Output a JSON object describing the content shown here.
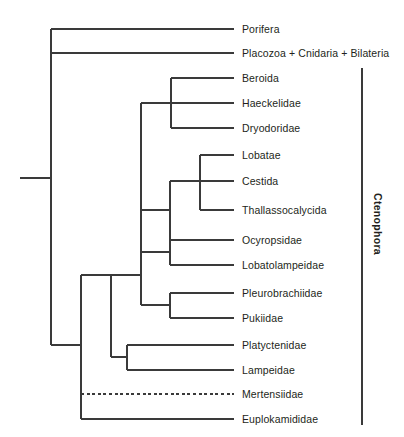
{
  "figure": {
    "type": "phylogenetic-cladogram",
    "background_color": "#ffffff",
    "line_color": "#3a3a3a",
    "text_color": "#231f20",
    "width": 404,
    "height": 437
  },
  "clade_brackets": [
    {
      "label": "Ctenophora",
      "orientation": "vertical-rotated",
      "x": 362,
      "y_top": 68,
      "y_bottom": 425,
      "label_x": 378,
      "label_center_y": 224
    }
  ],
  "taxa": [
    {
      "name": "Porifera",
      "tip_y": 29,
      "branch_x": 51,
      "label_x": 242,
      "style": "solid"
    },
    {
      "name": "Placozoa + Cnidaria + Bilateria",
      "tip_y": 53,
      "branch_x": 51,
      "label_x": 242,
      "style": "solid"
    },
    {
      "name": "Beroida",
      "tip_y": 78,
      "branch_x": 171,
      "label_x": 242,
      "style": "solid"
    },
    {
      "name": "Haeckelidae",
      "tip_y": 103,
      "branch_x": 141,
      "label_x": 242,
      "style": "solid"
    },
    {
      "name": "Dryodoridae",
      "tip_y": 128,
      "branch_x": 171,
      "label_x": 242,
      "style": "solid"
    },
    {
      "name": "Lobatae",
      "tip_y": 155,
      "branch_x": 200,
      "label_x": 242,
      "style": "solid"
    },
    {
      "name": "Cestida",
      "tip_y": 181,
      "branch_x": 170,
      "label_x": 242,
      "style": "solid"
    },
    {
      "name": "Thallassocalycida",
      "tip_y": 210,
      "branch_x": 200,
      "label_x": 242,
      "style": "solid"
    },
    {
      "name": "Ocyropsidae",
      "tip_y": 240,
      "branch_x": 170,
      "label_x": 242,
      "style": "solid"
    },
    {
      "name": "Lobatolampeidae",
      "tip_y": 265,
      "branch_x": 170,
      "label_x": 242,
      "style": "solid"
    },
    {
      "name": "Pleurobrachiidae",
      "tip_y": 293,
      "branch_x": 170,
      "label_x": 242,
      "style": "solid"
    },
    {
      "name": "Pukiidae",
      "tip_y": 318,
      "branch_x": 170,
      "label_x": 242,
      "style": "solid"
    },
    {
      "name": "Platyctenidae",
      "tip_y": 345,
      "branch_x": 127,
      "label_x": 242,
      "style": "solid"
    },
    {
      "name": "Lampeidae",
      "tip_y": 370,
      "branch_x": 127,
      "label_x": 242,
      "style": "solid"
    },
    {
      "name": "Mertensiidae",
      "tip_y": 394,
      "branch_x": 81,
      "label_x": 242,
      "style": "dashed"
    },
    {
      "name": "Euplokamididae",
      "tip_y": 419,
      "branch_x": 81,
      "label_x": 242,
      "style": "solid"
    }
  ],
  "tip_line_end_x": 234,
  "branches": {
    "root_stub": {
      "x1": 20,
      "x2": 51,
      "y": 178
    },
    "vertical_nodes": [
      {
        "name": "root-node",
        "x": 51,
        "y1": 29,
        "y2": 345
      },
      {
        "name": "ctenophora-node",
        "x": 81,
        "y1": 275,
        "y2": 419
      },
      {
        "name": "cydippid-core-node",
        "x": 111,
        "y1": 275,
        "y2": 357
      },
      {
        "name": "tentaculata-node",
        "x": 127,
        "y1": 345,
        "y2": 370
      },
      {
        "name": "beroida-haeckelid-node",
        "x": 171,
        "y1": 78,
        "y2": 128
      },
      {
        "name": "upper-clade-node",
        "x": 141,
        "y1": 103,
        "y2": 305
      },
      {
        "name": "lobate-node",
        "x": 200,
        "y1": 155,
        "y2": 210
      },
      {
        "name": "cestida-lobate-node",
        "x": 170,
        "y1": 181,
        "y2": 240
      },
      {
        "name": "ocyropsid-lobatolampeid-node",
        "x": 170,
        "y1": 240,
        "y2": 265
      },
      {
        "name": "pleurobrachiid-pukiid-node",
        "x": 170,
        "y1": 293,
        "y2": 318
      }
    ],
    "connectors": [
      {
        "name": "root-to-ctenophora",
        "x1": 51,
        "x2": 81,
        "y": 345
      },
      {
        "name": "ctenophora-to-core",
        "x1": 81,
        "x2": 111,
        "y": 275
      },
      {
        "name": "core-to-tentaculata",
        "x1": 111,
        "x2": 127,
        "y": 357
      },
      {
        "name": "core-to-upper",
        "x1": 111,
        "x2": 141,
        "y": 275
      },
      {
        "name": "upper-to-beroida-node",
        "x1": 141,
        "x2": 171,
        "y": 103
      },
      {
        "name": "upper-to-cestida-node",
        "x1": 141,
        "x2": 170,
        "y": 210
      },
      {
        "name": "upper-to-ocyro-node",
        "x1": 141,
        "x2": 170,
        "y": 252
      },
      {
        "name": "upper-to-pleuro-node",
        "x1": 141,
        "x2": 170,
        "y": 305
      },
      {
        "name": "cestida-to-lobate-node",
        "x1": 170,
        "x2": 200,
        "y": 181
      }
    ]
  }
}
